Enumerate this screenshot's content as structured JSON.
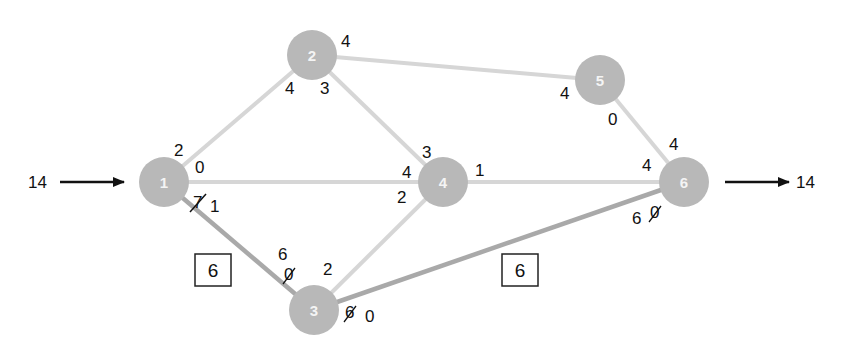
{
  "diagram": {
    "type": "flow-network",
    "source_flow": {
      "value": "14",
      "label": "14"
    },
    "sink_flow": {
      "value": "14",
      "label": "14"
    },
    "nodes": [
      {
        "id": "1",
        "label": "1"
      },
      {
        "id": "2",
        "label": "2"
      },
      {
        "id": "3",
        "label": "3"
      },
      {
        "id": "4",
        "label": "4"
      },
      {
        "id": "5",
        "label": "5"
      },
      {
        "id": "6",
        "label": "6"
      }
    ],
    "edges": [
      {
        "from": "1",
        "to": "2",
        "emphasized": false
      },
      {
        "from": "1",
        "to": "4",
        "emphasized": false
      },
      {
        "from": "1",
        "to": "3",
        "emphasized": true
      },
      {
        "from": "2",
        "to": "4",
        "emphasized": false
      },
      {
        "from": "2",
        "to": "5",
        "emphasized": false
      },
      {
        "from": "3",
        "to": "4",
        "emphasized": false
      },
      {
        "from": "3",
        "to": "6",
        "emphasized": true
      },
      {
        "from": "4",
        "to": "6",
        "emphasized": false
      },
      {
        "from": "5",
        "to": "6",
        "emphasized": false
      }
    ],
    "capacity_labels": {
      "n1_to_2": "2",
      "n1_to_4": "0",
      "n1_to_3_old": "7",
      "n1_to_3_new": "1",
      "n2_to_1": "4",
      "n2_to_4": "3",
      "n2_to_5": "4",
      "n4_from_2": "3",
      "n4_from_1": "4",
      "n4_to_6": "1",
      "n4_from_3": "2",
      "n5_from_2": "4",
      "n5_to_6": "0",
      "n6_from_5": "4",
      "n6_from_4": "4",
      "n6_from_3_a": "6",
      "n6_from_3_b_struck": "0",
      "n3_from_1_a": "6",
      "n3_from_1_b_struck": "0",
      "n3_to_4": "2",
      "n3_to_6_struck": "6",
      "n3_to_6_new": "0"
    },
    "path_flow_boxes": [
      {
        "id": "box-left",
        "label": "6"
      },
      {
        "id": "box-right",
        "label": "6"
      }
    ],
    "colors": {
      "node_fill": "#b8b8b8",
      "edge": "#d6d6d6",
      "edge_emphasized": "#a9a9a9",
      "text": "#111111"
    }
  }
}
